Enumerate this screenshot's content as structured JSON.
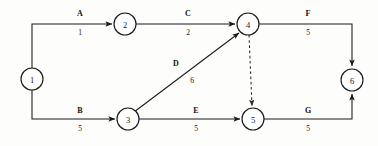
{
  "diagram": {
    "type": "activity-on-arrow-network",
    "title": "",
    "background_color": "#fdfdfc",
    "line_color": "#1a1a1a",
    "nodes": [
      {
        "id": "1",
        "label": "1",
        "cx": 32,
        "cy": 79,
        "r": 11
      },
      {
        "id": "2",
        "label": "2",
        "cx": 125,
        "cy": 24,
        "r": 11
      },
      {
        "id": "3",
        "label": "3",
        "cx": 128,
        "cy": 119,
        "r": 11
      },
      {
        "id": "4",
        "label": "4",
        "cx": 248,
        "cy": 24,
        "r": 11
      },
      {
        "id": "5",
        "label": "5",
        "cx": 253,
        "cy": 119,
        "r": 11
      },
      {
        "id": "6",
        "label": "6",
        "cx": 352,
        "cy": 80,
        "r": 11
      }
    ],
    "edges": [
      {
        "id": "A",
        "name": "A",
        "value": "1",
        "from": "1",
        "to": "2",
        "style": "solid",
        "label_x": 80,
        "name_y": 16,
        "value_y": 35
      },
      {
        "id": "C",
        "name": "C",
        "value": "2",
        "from": "2",
        "to": "4",
        "style": "solid",
        "label_x": 188,
        "name_y": 16,
        "value_y": 35
      },
      {
        "id": "F",
        "name": "F",
        "value": "5",
        "from": "4",
        "to": "6",
        "style": "solid",
        "label_x": 308,
        "name_y": 16,
        "value_y": 35
      },
      {
        "id": "B",
        "name": "B",
        "value": "5",
        "from": "1",
        "to": "3",
        "style": "solid",
        "label_x": 80,
        "name_y": 113,
        "value_y": 131
      },
      {
        "id": "E",
        "name": "E",
        "value": "5",
        "from": "3",
        "to": "5",
        "style": "solid",
        "label_x": 196,
        "name_y": 113,
        "value_y": 131
      },
      {
        "id": "G",
        "name": "G",
        "value": "5",
        "from": "5",
        "to": "6",
        "style": "solid",
        "label_x": 308,
        "name_y": 113,
        "value_y": 131
      },
      {
        "id": "D",
        "name": "D",
        "value": "6",
        "from": "3",
        "to": "4",
        "style": "solid-diagonal",
        "label_x": 176,
        "name_y": 66,
        "value_y": 83
      },
      {
        "id": "dummy",
        "name": "",
        "value": "",
        "from": "4",
        "to": "5",
        "style": "dashed",
        "label_x": 0,
        "name_y": 0,
        "value_y": 0
      }
    ]
  }
}
